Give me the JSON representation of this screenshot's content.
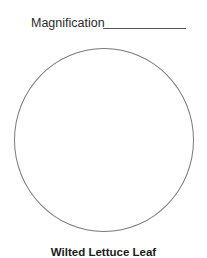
{
  "header": {
    "magnification_label": "Magnification",
    "magnification_value": ""
  },
  "drawing_area": {
    "shape": "circle",
    "content": ""
  },
  "caption": {
    "title": "Wilted Lettuce Leaf"
  }
}
